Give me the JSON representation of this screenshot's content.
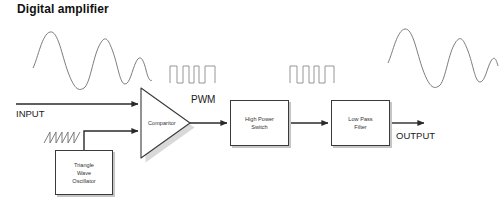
{
  "diagram": {
    "title": "Digital amplifier",
    "background_color": "#ffffff",
    "line_color": "#3a3a3a",
    "text_color": "#333333"
  },
  "labels": {
    "input": "INPUT",
    "output": "OUTPUT",
    "pwm": "PWM"
  },
  "blocks": [
    {
      "id": "comparator",
      "label": "Comparitor",
      "shape": "triangle"
    },
    {
      "id": "triangle-wave-oscillator",
      "label": "Triangle\nWave\nOscillator",
      "shape": "rect"
    },
    {
      "id": "high-power-switch",
      "label": "High Power\nSwitch",
      "shape": "rect"
    },
    {
      "id": "low-pass-filter",
      "label": "Low Pass\nFilter",
      "shape": "rect"
    }
  ],
  "waveforms": [
    {
      "id": "input-waveform",
      "type": "damped-sine",
      "cycles": 4
    },
    {
      "id": "triangle-waveform",
      "type": "sawtooth",
      "cycles": 3.5
    },
    {
      "id": "pwm-waveform-1",
      "type": "square-pulse-train",
      "pulses": 4
    },
    {
      "id": "pwm-waveform-2",
      "type": "square-pulse-train",
      "pulses": 4
    },
    {
      "id": "output-waveform",
      "type": "damped-sine",
      "cycles": 4
    }
  ]
}
